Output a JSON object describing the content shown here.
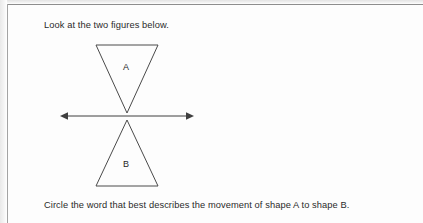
{
  "document": {
    "type": "worksheet-question",
    "prompt_top": "Look at the two figures below.",
    "prompt_bottom": "Circle the word that best describes the movement of shape A to shape B."
  },
  "figure": {
    "colors": {
      "ink": "#3a3a3a",
      "line": "#4a4a4a",
      "page": "#ffffff",
      "border": "#8d8d8d"
    },
    "mirror_line": {
      "name": "line-of-reflection",
      "y": 116,
      "x_start": 60,
      "x_end": 194,
      "arrowheads": "both"
    },
    "shapes": [
      {
        "id": "A",
        "label": "A",
        "orientation": "point-down",
        "vertices": "96,45 158,45 127,113",
        "label_x": 127,
        "label_y": 68
      },
      {
        "id": "B",
        "label": "B",
        "orientation": "point-up",
        "vertices": "127,120 158,186 96,186",
        "label_x": 127,
        "label_y": 165
      }
    ]
  }
}
